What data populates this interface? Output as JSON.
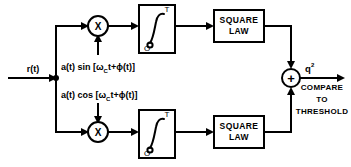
{
  "figure": {
    "type": "block-diagram",
    "background": "#ffffff",
    "line_color": "#000000",
    "width": 351,
    "height": 167
  },
  "input": {
    "label": "r(t)"
  },
  "branches": {
    "upper": {
      "reference_label": "a(t) sin [ω",
      "reference_sub": "C",
      "reference_tail": "t+ϕ(t)]",
      "multiplier_symbol": "X",
      "integrator_upper_limit": "T",
      "integrator_lower_limit": "O",
      "integrator_symbol": "∫",
      "squarer_line1": "SQUARE",
      "squarer_line2": "LAW"
    },
    "lower": {
      "reference_label": "a(t) cos [ω",
      "reference_sub": "C",
      "reference_tail": "t+ϕ(t)]",
      "multiplier_symbol": "X",
      "integrator_upper_limit": "T",
      "integrator_lower_limit": "O",
      "integrator_symbol": "∫",
      "squarer_line1": "SQUARE",
      "squarer_line2": "LAW"
    }
  },
  "summer": {
    "symbol": "+"
  },
  "output": {
    "label_base": "q",
    "label_exponent": "2",
    "decision_line1": "COMPARE",
    "decision_line2": "TO",
    "decision_line3": "THRESHOLD"
  }
}
